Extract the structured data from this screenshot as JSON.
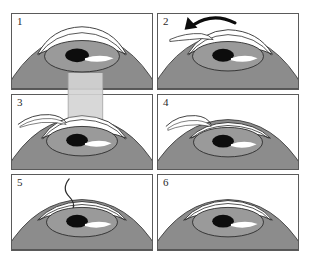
{
  "figure": {
    "background_color": "#ffffff",
    "panel_border_color": "#5a5a5a",
    "columns": 2,
    "rows": 3
  },
  "colors": {
    "sclera": "#8c8c8c",
    "sclera_dark": "#7d7d7d",
    "iris": "#9a9a9a",
    "iris_outline": "#2b2b2b",
    "pupil": "#0d0d0d",
    "highlight": "#ffffff",
    "cornea_fill": "#ffffff",
    "cornea_stroke": "#2b2b2b",
    "flap": "#ffffff",
    "laser_beam": "#d4d4d4",
    "laser_beam_edge": "#9e9e9e",
    "arrow": "#0d0d0d",
    "instrument": "#3a3a3a"
  },
  "panels": [
    {
      "number": "1",
      "name": "panel-intact-eye",
      "caption": "Intact eye with natural corneal dome",
      "has_arrow": false,
      "has_beam": false,
      "has_instrument": false,
      "flap_state": "closed",
      "cornea_state": "domed"
    },
    {
      "number": "2",
      "name": "panel-flap-lifted",
      "caption": "Corneal flap cut and folded back",
      "has_arrow": true,
      "has_beam": false,
      "has_instrument": true,
      "flap_state": "lifted",
      "cornea_state": "domed"
    },
    {
      "number": "3",
      "name": "panel-laser-ablation",
      "caption": "Excimer laser reshapes the exposed stroma",
      "has_arrow": false,
      "has_beam": true,
      "has_instrument": true,
      "flap_state": "lifted",
      "cornea_state": "domed"
    },
    {
      "number": "4",
      "name": "panel-reshaped-cornea",
      "caption": "Cornea flattened after ablation",
      "has_arrow": false,
      "has_beam": false,
      "has_instrument": true,
      "flap_state": "lifted",
      "cornea_state": "flattened"
    },
    {
      "number": "5",
      "name": "panel-flap-repositioned",
      "caption": "Flap smoothed back into position",
      "has_arrow": false,
      "has_beam": false,
      "has_instrument": true,
      "flap_state": "repositioning",
      "cornea_state": "flattened"
    },
    {
      "number": "6",
      "name": "panel-healed-eye",
      "caption": "Healed eye with corrected curvature",
      "has_arrow": false,
      "has_beam": false,
      "has_instrument": false,
      "flap_state": "closed",
      "cornea_state": "flattened"
    }
  ]
}
